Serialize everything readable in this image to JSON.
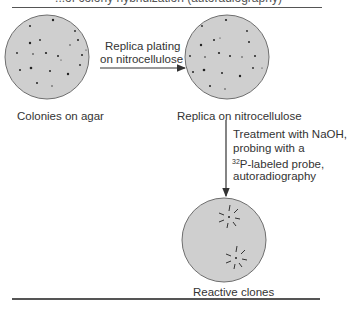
{
  "caption_top": "...of colony hybridization (autoradiography)",
  "plates": [
    {
      "id": "agar",
      "label": "Colonies on agar"
    },
    {
      "id": "nitrocellulose",
      "label": "Replica on nitrocellulose"
    },
    {
      "id": "reactive",
      "label": "Reactive clones"
    }
  ],
  "steps": [
    {
      "id": "replica",
      "lines": [
        "Replica plating",
        "on nitrocellulose"
      ]
    },
    {
      "id": "probe",
      "lines": [
        "Treatment with NaOH,",
        "probing with a",
        "-labeled probe,",
        "autoradiography"
      ],
      "isotope_mass": "32",
      "isotope_symbol": "P"
    }
  ],
  "colors": {
    "plate_fill": "#cfcfcf",
    "plate_stroke": "#6e6e6e",
    "colony": "#222222",
    "rule": "#555555"
  }
}
